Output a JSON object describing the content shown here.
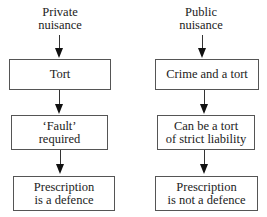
{
  "columns": [
    {
      "heading": [
        "Private",
        "nuisance"
      ],
      "boxes": [
        {
          "lines": [
            "Tort"
          ]
        },
        {
          "lines": [
            "‘Fault’",
            "required"
          ]
        },
        {
          "lines": [
            "Prescription",
            "is a defence"
          ]
        }
      ]
    },
    {
      "heading": [
        "Public",
        "nuisance"
      ],
      "boxes": [
        {
          "lines": [
            "Crime and a tort"
          ]
        },
        {
          "lines": [
            "Can be a tort",
            "of strict liability"
          ]
        },
        {
          "lines": [
            "Prescription",
            "is not a defence"
          ]
        }
      ]
    }
  ]
}
